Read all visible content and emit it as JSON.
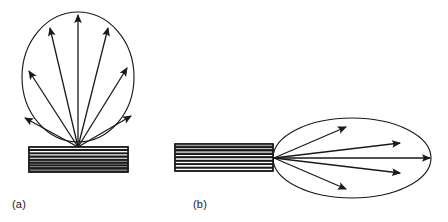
{
  "figure": {
    "background_color": "#ffffff",
    "stroke_color": "#1a1a1a",
    "hatch_color": "#1a1a1a",
    "width": 448,
    "height": 222,
    "panels": [
      {
        "id": "a",
        "caption": "(a)",
        "caption_x": 12,
        "caption_y": 198,
        "envelope": {
          "shape": "circle",
          "center_x": 78,
          "center_y": 77,
          "radius_x": 56,
          "radius_y": 65
        },
        "aperture": {
          "shape": "rectangle",
          "x": 29,
          "y": 147,
          "width": 99,
          "height": 25,
          "hatch_orientation": "horizontal",
          "hatch_line_count": 7
        },
        "source": {
          "x": 78,
          "y": 147
        },
        "beam_count": 7,
        "beam_angles_deg": [
          150,
          128,
          108,
          90,
          72,
          52,
          30
        ],
        "beam_tips": [
          {
            "x": 25,
            "y": 118
          },
          {
            "x": 29,
            "y": 71
          },
          {
            "x": 50,
            "y": 28
          },
          {
            "x": 78,
            "y": 15
          },
          {
            "x": 108,
            "y": 28
          },
          {
            "x": 127,
            "y": 68
          },
          {
            "x": 131,
            "y": 116
          }
        ]
      },
      {
        "id": "b",
        "caption": "(b)",
        "caption_x": 193,
        "caption_y": 198,
        "envelope": {
          "shape": "ellipse",
          "center_x": 352,
          "center_y": 158,
          "radius_x": 79,
          "radius_y": 40
        },
        "aperture": {
          "shape": "rectangle",
          "x": 175,
          "y": 144,
          "width": 98,
          "height": 27,
          "hatch_orientation": "horizontal",
          "hatch_line_count": 7
        },
        "source": {
          "x": 274,
          "y": 158
        },
        "beam_count": 5,
        "beam_angles_deg": [
          20,
          10,
          0,
          -10,
          -20
        ],
        "beam_tips": [
          {
            "x": 346,
            "y": 127
          },
          {
            "x": 400,
            "y": 143
          },
          {
            "x": 430,
            "y": 158
          },
          {
            "x": 400,
            "y": 173
          },
          {
            "x": 346,
            "y": 189
          }
        ]
      }
    ]
  }
}
